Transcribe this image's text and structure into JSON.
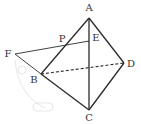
{
  "diagram": {
    "type": "tetrahedron-geometry",
    "colors": {
      "line": "#2b2b2b",
      "label": "#333333",
      "faint": "#e6e6e6"
    },
    "points": {
      "A": {
        "label": "A",
        "x": 89,
        "y": 18,
        "lx": 89,
        "ly": 11
      },
      "B": {
        "label": "B",
        "x": 41,
        "y": 74,
        "lx": 34,
        "ly": 83
      },
      "C": {
        "label": "C",
        "x": 89,
        "y": 110,
        "lx": 89,
        "ly": 121
      },
      "D": {
        "label": "D",
        "x": 124,
        "y": 63,
        "lx": 131,
        "ly": 67
      },
      "E": {
        "label": "E",
        "x": 89,
        "y": 41,
        "lx": 96,
        "ly": 41
      },
      "F": {
        "label": "F",
        "x": 15,
        "y": 54,
        "lx": 8,
        "ly": 57
      },
      "P": {
        "label": "P",
        "x": 64,
        "y": 45,
        "lx": 62,
        "ly": 42
      }
    },
    "segments": [
      {
        "from": "A",
        "to": "B",
        "style": "solid"
      },
      {
        "from": "A",
        "to": "C",
        "style": "solid"
      },
      {
        "from": "A",
        "to": "D",
        "style": "solid"
      },
      {
        "from": "B",
        "to": "C",
        "style": "solid"
      },
      {
        "from": "C",
        "to": "D",
        "style": "solid"
      },
      {
        "from": "B",
        "to": "D",
        "style": "dashed"
      },
      {
        "from": "F",
        "to": "E",
        "style": "solid-thin"
      },
      {
        "from": "F",
        "to": "B",
        "style": "solid-thin"
      }
    ]
  }
}
